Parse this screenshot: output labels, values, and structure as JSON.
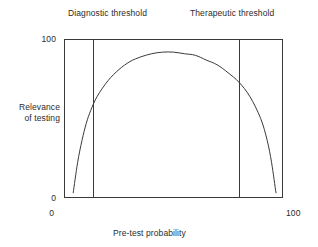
{
  "figure": {
    "background": "#ffffff",
    "line_color": "#3a3a3a",
    "text_color": "#2b2b2b"
  },
  "annotations": {
    "diagnostic_threshold_label": "Diagnostic threshold",
    "therapeutic_threshold_label": "Therapeutic threshold"
  },
  "axes": {
    "y_title_line1": "Relevance",
    "y_title_line2": "of testing",
    "x_title": "Pre-test probability",
    "y_tick_top": "100",
    "y_tick_bottom": "0",
    "x_tick_left": "0",
    "x_tick_right": "100"
  },
  "chart_data": {
    "type": "line",
    "title": "",
    "xlabel": "Pre-test probability",
    "ylabel": "Relevance of testing",
    "xlim": [
      0,
      100
    ],
    "ylim": [
      0,
      100
    ],
    "grid": false,
    "legend": null,
    "x_ticks": [
      0,
      100
    ],
    "x_ticklabels": [
      "0",
      "100"
    ],
    "y_ticks": [
      0,
      100
    ],
    "y_ticklabels": [
      "0",
      "100"
    ],
    "series": [
      {
        "name": "Relevance of testing",
        "comment": "Inverted-U curve: near zero relevance at very low and very high pre-test probability, peaking near mid-range.",
        "x": [
          4,
          6,
          8,
          10,
          12,
          15,
          20,
          25,
          30,
          35,
          40,
          45,
          50,
          55,
          60,
          65,
          70,
          75,
          80,
          85,
          90,
          93,
          95,
          97
        ],
        "y": [
          3,
          22,
          36,
          47,
          55,
          64,
          74,
          81,
          86,
          89,
          91,
          92,
          92,
          91,
          90,
          87,
          84,
          79,
          73,
          64,
          50,
          36,
          22,
          3
        ]
      }
    ],
    "vlines": [
      {
        "name": "Diagnostic threshold",
        "x": 13,
        "label": "Diagnostic threshold"
      },
      {
        "name": "Therapeutic threshold",
        "x": 80,
        "label": "Therapeutic threshold"
      }
    ]
  }
}
